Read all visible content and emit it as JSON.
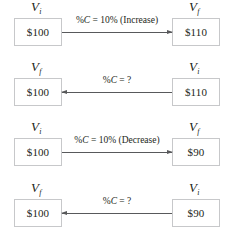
{
  "figure": {
    "panels": [
      {
        "id": "panel-increase-known",
        "left": {
          "symbol": "V",
          "subscript": "i",
          "value": "$100",
          "role": "initial-value"
        },
        "right": {
          "symbol": "V",
          "subscript": "f",
          "value": "$110",
          "role": "final-value"
        },
        "arrow": {
          "direction": "right",
          "icon": "arrow-right-icon"
        },
        "label": {
          "prefix": "%",
          "variable": "C",
          "expression": " = 10% (Increase)",
          "full": "%C = 10% (Increase)"
        }
      },
      {
        "id": "panel-increase-unknown",
        "left": {
          "symbol": "V",
          "subscript": "f",
          "value": "$100",
          "role": "final-value"
        },
        "right": {
          "symbol": "V",
          "subscript": "i",
          "value": "$110",
          "role": "initial-value"
        },
        "arrow": {
          "direction": "left",
          "icon": "arrow-left-icon"
        },
        "label": {
          "prefix": "%",
          "variable": "C",
          "expression": " = ?",
          "full": "%C = ?"
        }
      },
      {
        "id": "panel-decrease-known",
        "left": {
          "symbol": "V",
          "subscript": "i",
          "value": "$100",
          "role": "initial-value"
        },
        "right": {
          "symbol": "V",
          "subscript": "f",
          "value": "$90",
          "role": "final-value"
        },
        "arrow": {
          "direction": "right",
          "icon": "arrow-right-icon"
        },
        "label": {
          "prefix": "%",
          "variable": "C",
          "expression": " = 10% (Decrease)",
          "full": "%C = 10% (Decrease)"
        }
      },
      {
        "id": "panel-decrease-unknown",
        "left": {
          "symbol": "V",
          "subscript": "f",
          "value": "$100",
          "role": "final-value"
        },
        "right": {
          "symbol": "V",
          "subscript": "i",
          "value": "$90",
          "role": "initial-value"
        },
        "arrow": {
          "direction": "left",
          "icon": "arrow-left-icon"
        },
        "label": {
          "prefix": "%",
          "variable": "C",
          "expression": " = ?",
          "full": "%C = ?"
        }
      }
    ],
    "colors": {
      "text": "#231f20",
      "box_border": "#c7c8ca",
      "arrow": "#58595b",
      "background": "#ffffff"
    }
  }
}
